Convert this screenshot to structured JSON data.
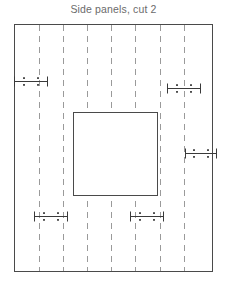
{
  "title": "Side panels, cut 2",
  "colors": {
    "background": "#ffffff",
    "title_text": "#6b6b6b",
    "outline": "#4a4a4a",
    "fold_line": "#9a9a9a",
    "marker": "#3a3a3a"
  },
  "canvas": {
    "width": 227,
    "height": 291
  },
  "outer_panel": {
    "label": "panel outline",
    "x": 14.5,
    "y": 24.5,
    "width": 198,
    "height": 247,
    "stroke_width": 1
  },
  "inner_cutout": {
    "label": "center cutout",
    "x": 73.5,
    "y": 112.5,
    "width": 84,
    "height": 83,
    "stroke_width": 1
  },
  "fold_lines": {
    "label": "fold lines",
    "orientation": "vertical",
    "dash_pattern": "6 5",
    "x_positions": [
      39,
      63,
      87,
      111,
      135,
      160,
      184
    ],
    "y_top": 25,
    "y_bottom": 271
  },
  "markers": [
    {
      "name": "marker-left-upper",
      "cx": 31,
      "cy": 81,
      "half_width": 17
    },
    {
      "name": "marker-right-upper",
      "cx": 184,
      "cy": 88,
      "half_width": 17
    },
    {
      "name": "marker-right-edge",
      "cx": 201,
      "cy": 153,
      "half_width": 16
    },
    {
      "name": "marker-bottom-left",
      "cx": 51,
      "cy": 216,
      "half_width": 17
    },
    {
      "name": "marker-bottom-mid",
      "cx": 147,
      "cy": 216,
      "half_width": 17
    }
  ],
  "marker_style": {
    "line_stroke_width": 1,
    "tick_half_height": 5,
    "dot_size": 1.8,
    "dot_dx": 7,
    "dot_dy": 3.4
  }
}
